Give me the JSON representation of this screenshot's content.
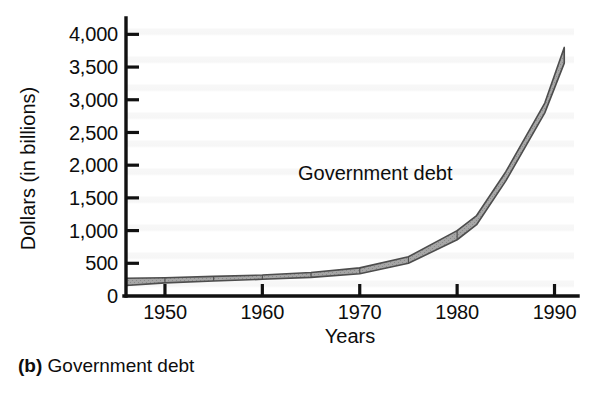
{
  "figure": {
    "caption_tag": "(b)",
    "caption_text": "Government debt"
  },
  "chart_data": {
    "type": "area",
    "title": "",
    "subtitle": "",
    "xlabel": "Years",
    "ylabel": "Dollars (in billions)",
    "series_label": "Government debt",
    "xlim": [
      1946,
      1992
    ],
    "ylim": [
      0,
      4250
    ],
    "xticks": [
      1950,
      1960,
      1970,
      1980,
      1990
    ],
    "xticklabels": [
      "1950",
      "1960",
      "1970",
      "1980",
      "1990"
    ],
    "yticks": [
      0,
      500,
      1000,
      1500,
      2000,
      2500,
      3000,
      3500,
      4000
    ],
    "yticklabels": [
      "0",
      "500",
      "1,000",
      "1,500",
      "2,000",
      "2,500",
      "3,000",
      "3,500",
      "4,000"
    ],
    "grid": false,
    "legend": "none",
    "x": [
      1946,
      1950,
      1955,
      1960,
      1965,
      1970,
      1975,
      1980,
      1982,
      1985,
      1989,
      1991
    ],
    "values": [
      271,
      257,
      274,
      291,
      323,
      381,
      542,
      909,
      1142,
      1823,
      2868,
      3665
    ],
    "band_upper": [
      271,
      280,
      300,
      320,
      360,
      430,
      600,
      1000,
      1230,
      1900,
      2950,
      3800
    ],
    "band_lower": [
      160,
      200,
      230,
      255,
      285,
      340,
      500,
      860,
      1090,
      1760,
      2800,
      3560
    ],
    "band_segment_years": [
      1950,
      1955,
      1960,
      1965,
      1970,
      1975,
      1980
    ],
    "colors": {
      "band_fill": "#9a9a9a",
      "band_stroke": "#4a4a4a",
      "axis": "#111111",
      "text": "#0d0d0d",
      "background": "#ffffff"
    }
  }
}
